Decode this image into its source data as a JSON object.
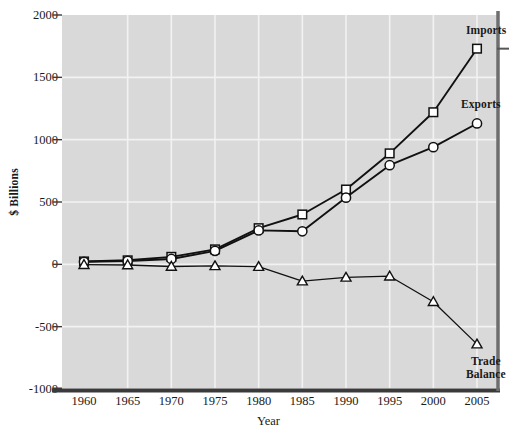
{
  "chart_data": {
    "type": "line",
    "title": "",
    "subtitle": "",
    "xlabel": "Year",
    "ylabel": "$ Billions",
    "x": [
      1960,
      1965,
      1970,
      1975,
      1980,
      1985,
      1990,
      1995,
      2000,
      2005
    ],
    "xtick_labels": [
      "1960",
      "1965",
      "1970",
      "1975",
      "1980",
      "1985",
      "1990",
      "1995",
      "2000",
      "2005"
    ],
    "ytick_labels": [
      "2000",
      "1500",
      "1000",
      "500",
      "0",
      "-500",
      "-1000"
    ],
    "yticks": [
      2000,
      1500,
      1000,
      500,
      0,
      -500,
      -1000
    ],
    "xlim": [
      1960,
      2005
    ],
    "ylim": [
      -1000,
      2000
    ],
    "grid": true,
    "legend_position": "right-inline-annotations",
    "series": [
      {
        "name": "Imports",
        "marker": "square",
        "values": [
          23,
          32,
          60,
          120,
          290,
          400,
          600,
          890,
          1220,
          1730
        ]
      },
      {
        "name": "Exports",
        "marker": "circle",
        "values": [
          20,
          27,
          43,
          108,
          272,
          265,
          535,
          795,
          940,
          1130
        ]
      },
      {
        "name": "Trade Balance",
        "marker": "triangle",
        "values": [
          -3,
          -5,
          -17,
          -12,
          -18,
          -135,
          -105,
          -95,
          -300,
          -640
        ]
      }
    ],
    "annotations": [
      {
        "text": "Imports",
        "series": "Imports"
      },
      {
        "text": "Exports",
        "series": "Exports"
      },
      {
        "text": "Trade",
        "series": "Trade Balance"
      },
      {
        "text": "Balance",
        "series": "Trade Balance"
      }
    ],
    "colors": {
      "plot_background": "#d9d9d9",
      "gridline": "#f2f2f2",
      "line": "#111111",
      "marker_fill": "#ffffff",
      "axis": "#3a3a3a",
      "text": "#1a1a1a"
    }
  }
}
